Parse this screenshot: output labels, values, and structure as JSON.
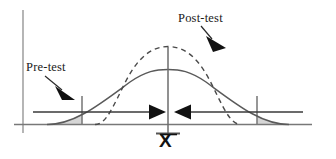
{
  "figure": {
    "type": "statistics-distribution-diagram",
    "labels": {
      "pretest": "Pre-test",
      "posttest": "Post-test",
      "mean": "X"
    },
    "axes": {
      "y_axis_present": true,
      "x_axis_present": true,
      "baseline_label": "X"
    },
    "colors": {
      "curve_stroke": "#555555",
      "axis_stroke": "#888888",
      "baseline_stroke": "#777777",
      "shaded_tail_fill": "#d6d6d6",
      "shaded_tail_stroke": "#8a8a8a",
      "arrow_fill": "#111111",
      "text": "#1a1a1a"
    },
    "series": [
      {
        "name": "Pre-test",
        "style": "solid",
        "shape": "wide-flat-bell",
        "peak_height_px": 54,
        "spread": "wide"
      },
      {
        "name": "Post-test",
        "style": "dashed",
        "shape": "narrow-tall-bell",
        "peak_height_px": 78,
        "spread": "narrow"
      }
    ],
    "annotations": [
      {
        "name": "pre-test-pointer",
        "text": "Pre-test",
        "arrow_direction": "down-right",
        "points_to": "solid pre-test curve left flank"
      },
      {
        "name": "post-test-pointer",
        "text": "Post-test",
        "arrow_direction": "down-right",
        "points_to": "dashed post-test curve right flank"
      },
      {
        "name": "left-convergence-arrow",
        "arrow_direction": "right",
        "meaning": "variance shrinks toward the mean"
      },
      {
        "name": "right-convergence-arrow",
        "arrow_direction": "left",
        "meaning": "variance shrinks toward the mean"
      }
    ],
    "shaded_regions": [
      {
        "name": "left-tail",
        "side": "left",
        "fill": "#d6d6d6"
      },
      {
        "name": "right-tail",
        "side": "right",
        "fill": "#d6d6d6"
      }
    ]
  }
}
